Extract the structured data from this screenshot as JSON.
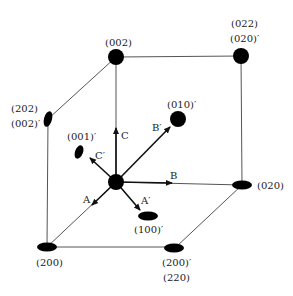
{
  "diagram": {
    "type": "reciprocal-lattice-cube",
    "nodes": [
      {
        "id": "n002",
        "labels": [
          "(002)"
        ]
      },
      {
        "id": "n022",
        "labels": [
          "(022)",
          "(020)′"
        ]
      },
      {
        "id": "n202",
        "labels": [
          "(202)",
          "(002)′"
        ]
      },
      {
        "id": "n010p",
        "labels": [
          "(010)′"
        ]
      },
      {
        "id": "n001p",
        "labels": [
          "(001)′"
        ]
      },
      {
        "id": "n020",
        "labels": [
          "(020)"
        ]
      },
      {
        "id": "n100p",
        "labels": [
          "(100)′"
        ]
      },
      {
        "id": "n200",
        "labels": [
          "(200)"
        ]
      },
      {
        "id": "n220",
        "labels": [
          "(200)′",
          "(220)"
        ]
      }
    ],
    "axes": {
      "A": "A",
      "B": "B",
      "C": "C",
      "A_prime": "A′",
      "B_prime": "B′",
      "C_prime": "C′"
    }
  }
}
